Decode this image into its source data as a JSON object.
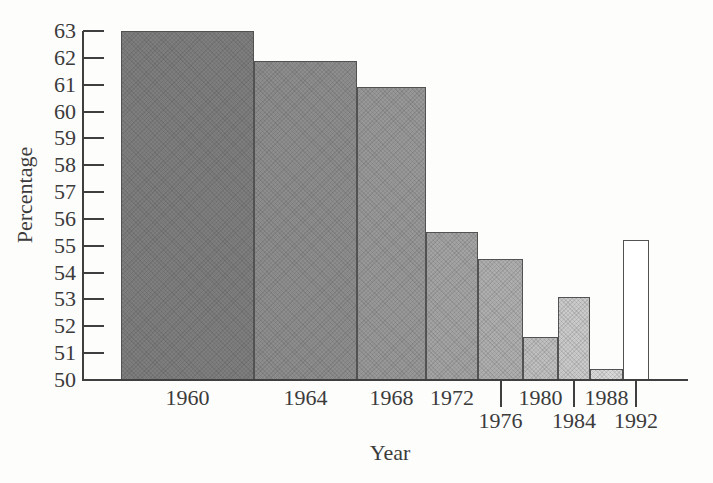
{
  "chart_data": {
    "type": "bar",
    "title": "",
    "xlabel": "Year",
    "ylabel": "Percentage",
    "ylim": [
      50,
      63
    ],
    "yticks": [
      50,
      51,
      52,
      53,
      54,
      55,
      56,
      57,
      58,
      59,
      60,
      61,
      62,
      63
    ],
    "grid": false,
    "axis_color": "#3f3f3f",
    "text_color": "#3b3b3b",
    "background_color": "#fdfdfc",
    "bar_border_color": "#525252",
    "layout_hints": {
      "bars_have_unequal_widths": true,
      "fills_lighten_left_to_right": true,
      "last_bar_unfilled_white": true,
      "x_labels_staggered_two_rows": true,
      "row2_labels_have_leader_ticks": true,
      "y_ticks_point_inward": true
    },
    "bars": [
      {
        "year": "1960",
        "value": 63.0,
        "width_px": 133,
        "fill": "#7e7e7e",
        "label_row": 1,
        "textured": true
      },
      {
        "year": "1964",
        "value": 61.9,
        "width_px": 103,
        "fill": "#8d8d8d",
        "label_row": 1,
        "textured": true
      },
      {
        "year": "1968",
        "value": 60.9,
        "width_px": 69,
        "fill": "#989898",
        "label_row": 1,
        "textured": true
      },
      {
        "year": "1972",
        "value": 55.5,
        "width_px": 52,
        "fill": "#a3a3a3",
        "label_row": 1,
        "textured": true
      },
      {
        "year": "1976",
        "value": 54.5,
        "width_px": 45,
        "fill": "#aeaeae",
        "label_row": 2,
        "textured": true
      },
      {
        "year": "1980",
        "value": 51.6,
        "width_px": 35,
        "fill": "#bfbfbf",
        "label_row": 1,
        "textured": true
      },
      {
        "year": "1984",
        "value": 53.1,
        "width_px": 32,
        "fill": "#cacaca",
        "label_row": 2,
        "textured": true
      },
      {
        "year": "1988",
        "value": 50.4,
        "width_px": 33,
        "fill": "#d8d8d8",
        "label_row": 1,
        "textured": true
      },
      {
        "year": "1992",
        "value": 55.2,
        "width_px": 26,
        "fill": "#ffffff",
        "label_row": 2,
        "textured": false
      }
    ]
  }
}
